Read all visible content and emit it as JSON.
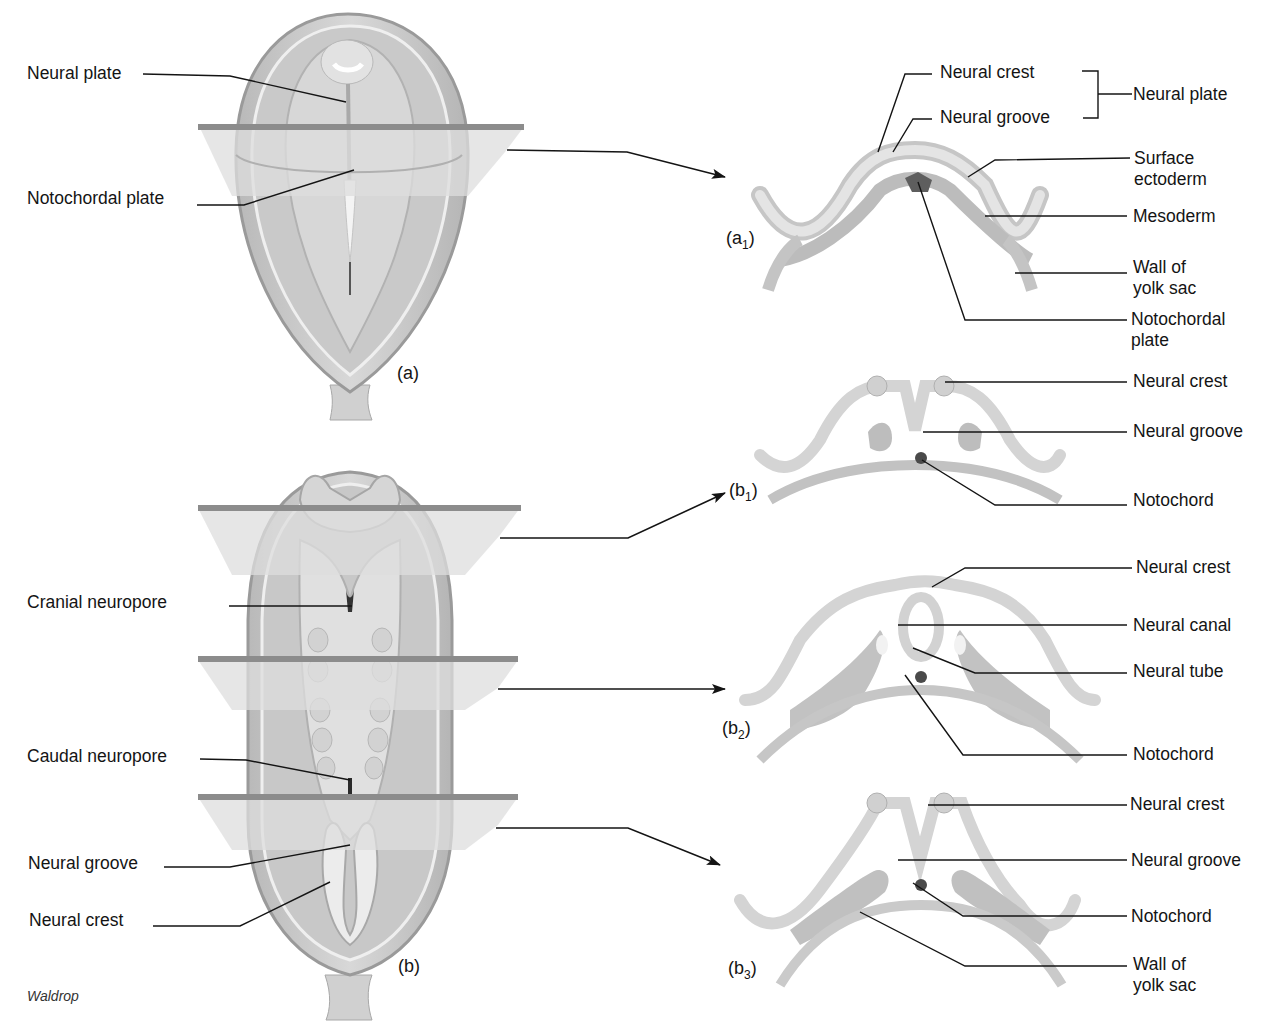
{
  "figure": {
    "credit": "Waldrop",
    "colors": {
      "tissue_light": "#dcdcdc",
      "tissue_mid": "#c2c2c2",
      "tissue_dark": "#9a9a9a",
      "plane_fill": "#d9d9d9",
      "plane_edge": "#8a8a8a",
      "notochord": "#5a5a5a",
      "leader_line": "#141414"
    },
    "views": {
      "a": {
        "panel_label": "(a)",
        "labels": [
          "Neural plate",
          "Notochordal plate"
        ]
      },
      "b": {
        "panel_label": "(b)",
        "labels": [
          "Cranial neuropore",
          "Caudal neuropore",
          "Neural groove",
          "Neural crest"
        ]
      }
    },
    "sections": {
      "a1": {
        "panel_label": "(a",
        "panel_sub": "1",
        "panel_close": ")",
        "labels": {
          "neural_crest": "Neural crest",
          "neural_groove": "Neural groove",
          "bracket_group": "Neural plate",
          "surface_ectoderm": "Surface\nectoderm",
          "mesoderm": "Mesoderm",
          "wall_yolk_sac": "Wall of\nyolk sac",
          "notochordal_plate": "Notochordal\nplate"
        }
      },
      "b1": {
        "panel_label": "(b",
        "panel_sub": "1",
        "panel_close": ")",
        "labels": {
          "neural_crest": "Neural crest",
          "neural_groove": "Neural groove",
          "notochord": "Notochord"
        }
      },
      "b2": {
        "panel_label": "(b",
        "panel_sub": "2",
        "panel_close": ")",
        "labels": {
          "neural_crest": "Neural crest",
          "neural_canal": "Neural canal",
          "neural_tube": "Neural tube",
          "notochord": "Notochord"
        }
      },
      "b3": {
        "panel_label": "(b",
        "panel_sub": "3",
        "panel_close": ")",
        "labels": {
          "neural_crest": "Neural crest",
          "neural_groove": "Neural groove",
          "notochord": "Notochord",
          "wall_yolk_sac": "Wall of\nyolk sac"
        }
      }
    }
  }
}
